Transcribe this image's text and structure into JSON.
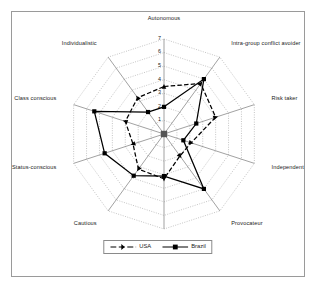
{
  "chart_data": {
    "type": "radar",
    "title": "",
    "categories": [
      "Autonomous",
      "Intra-group conflict avoider",
      "Risk taker",
      "Independent",
      "Provocateur",
      "Compassionate",
      "Cautious",
      "Status-conscious",
      "Class conscious",
      "Individualistic"
    ],
    "tick_labels": [
      "1",
      "2",
      "3",
      "4",
      "5",
      "6",
      "7"
    ],
    "rlim": [
      0,
      7
    ],
    "grid": true,
    "grid_style": "dotted",
    "legend_position": "bottom-center",
    "series": [
      {
        "name": "USA",
        "style": "dashed",
        "marker": "triangle",
        "color": "#000000",
        "values": [
          3.5,
          4.6,
          4.0,
          2.1,
          2.0,
          3.3,
          3.2,
          2.4,
          3.0,
          3.3
        ]
      },
      {
        "name": "Brazil",
        "style": "solid",
        "marker": "square",
        "color": "#000000",
        "values": [
          2.0,
          5.0,
          2.5,
          1.5,
          5.0,
          3.1,
          3.8,
          4.6,
          5.4,
          2.0
        ]
      }
    ]
  },
  "legend": {
    "items": [
      {
        "label": "USA"
      },
      {
        "label": "Brazil"
      }
    ]
  }
}
